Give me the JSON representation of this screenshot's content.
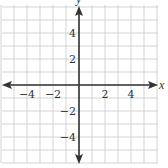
{
  "chart_data": {
    "type": "table",
    "title": "",
    "xlabel": "x",
    "ylabel": "y",
    "xlim": [
      -6,
      6
    ],
    "ylim": [
      -6,
      6
    ],
    "grid": true,
    "grid_step": 1,
    "x_ticks": [
      -4,
      -2,
      2,
      4
    ],
    "y_ticks": [
      4,
      2,
      -2,
      -4
    ],
    "x_tick_labels": [
      "−4",
      "−2",
      "2",
      "4"
    ],
    "y_tick_labels": [
      "4",
      "2",
      "−2",
      "−4"
    ],
    "axes_arrows": true,
    "series": []
  },
  "colors": {
    "grid": "#c8c8c8",
    "axis": "#333333",
    "background": "#ffffff"
  }
}
